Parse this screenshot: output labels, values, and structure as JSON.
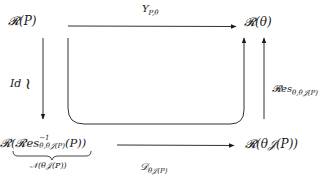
{
  "diagram": {
    "type": "commutative-diagram",
    "nodes": {
      "top_left": {
        "main": "𝓡(P)"
      },
      "top_right": {
        "main": "𝓡(θ)"
      },
      "bottom_left": {
        "main_prefix": "𝓡(𝓡es",
        "sup": "−1",
        "sub": "θ,θ𝒥(P)",
        "main_suffix": "(P))",
        "underbrace_label": "𝒩(θ𝒥(P))"
      },
      "bottom_right": {
        "main": "𝓡(θ𝒥(P))"
      }
    },
    "edges": {
      "top": {
        "label_main": "Υ",
        "label_sub": "P,θ",
        "from": "top_left",
        "to": "top_right"
      },
      "left": {
        "label": "Id",
        "symbol": "≀",
        "from": "top_left",
        "to": "bottom_left"
      },
      "right": {
        "label_main": "𝓡es",
        "label_sub": "θ,θ𝒥(P)",
        "from": "bottom_right",
        "to": "top_right"
      },
      "bottom": {
        "label_main": "𝒟",
        "label_sub": "θ𝒥(P)",
        "from": "bottom_left",
        "to": "bottom_right"
      },
      "loop": {
        "label": "",
        "from": "top_left",
        "to": "top_right",
        "via": "composite"
      }
    },
    "colors": {
      "stroke": "#1a1a1a",
      "background": "#ffffff"
    }
  }
}
